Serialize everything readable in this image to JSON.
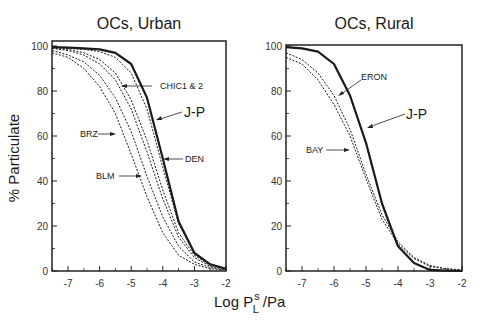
{
  "chart_data": [
    {
      "type": "line",
      "title": "OCs, Urban",
      "xlabel": "Log P_L^s /Pa",
      "ylabel": "% Particulate",
      "xlim": [
        -7.5,
        -2
      ],
      "ylim": [
        0,
        100
      ],
      "xticks": [
        -7,
        -6,
        -5,
        -4,
        -3,
        -2
      ],
      "yticks": [
        0,
        20,
        40,
        60,
        80,
        100
      ],
      "grid": false,
      "x": [
        -7.5,
        -7,
        -6.5,
        -6,
        -5.5,
        -5,
        -4.5,
        -4,
        -3.5,
        -3,
        -2.5,
        -2
      ],
      "series": [
        {
          "name": "J-P",
          "style": "solid-bold",
          "values": [
            99.5,
            99.3,
            99,
            98.5,
            97,
            92,
            77,
            50,
            22,
            8,
            3,
            1
          ]
        },
        {
          "name": "DEN",
          "style": "dotted",
          "values": [
            99.5,
            99,
            98.5,
            97.5,
            95,
            88,
            72,
            46,
            21,
            8,
            3,
            1
          ]
        },
        {
          "name": "CHIC1 & 2 (a)",
          "style": "dotted",
          "values": [
            99,
            98.5,
            97,
            94,
            88,
            76,
            58,
            36,
            17,
            7,
            2.5,
            1
          ]
        },
        {
          "name": "CHIC1 & 2 (b)",
          "style": "dotted",
          "values": [
            99,
            98,
            96,
            92,
            85,
            72,
            53,
            32,
            15,
            6,
            2,
            1
          ]
        },
        {
          "name": "BRZ",
          "style": "dotted",
          "values": [
            98,
            96,
            93,
            87,
            77,
            62,
            42,
            24,
            11,
            4,
            1.5,
            0.5
          ]
        },
        {
          "name": "BLM",
          "style": "dotted",
          "values": [
            97,
            95,
            90,
            82,
            70,
            52,
            33,
            17,
            7,
            3,
            1,
            0.5
          ]
        }
      ],
      "annotations": [
        "CHIC1 & 2",
        "J-P",
        "BRZ",
        "DEN",
        "BLM"
      ]
    },
    {
      "type": "line",
      "title": "OCs, Rural",
      "xlabel": "Log P_L^s /Pa",
      "ylabel": "% Particulate",
      "xlim": [
        -7.5,
        -2
      ],
      "ylim": [
        0,
        100
      ],
      "xticks": [
        -7,
        -6,
        -5,
        -4,
        -3,
        -2
      ],
      "yticks": [
        0,
        20,
        40,
        60,
        80,
        100
      ],
      "grid": false,
      "x": [
        -7.5,
        -7,
        -6.5,
        -6,
        -5.5,
        -5,
        -4.5,
        -4,
        -3.5,
        -3,
        -2.5,
        -2
      ],
      "series": [
        {
          "name": "J-P",
          "style": "solid-bold",
          "values": [
            99.5,
            99,
            97.5,
            92,
            78,
            57,
            30,
            11,
            3.5,
            0.5,
            0.2,
            0
          ]
        },
        {
          "name": "ERON",
          "style": "dotted",
          "values": [
            97,
            94,
            88,
            78,
            63,
            43,
            25,
            13,
            6,
            2.5,
            1,
            0.5
          ]
        },
        {
          "name": "BAY",
          "style": "dotted",
          "values": [
            95,
            92,
            85,
            74,
            60,
            41,
            23,
            12,
            5.5,
            2,
            1,
            0.5
          ]
        }
      ],
      "annotations": [
        "ERON",
        "J-P",
        "BAY"
      ]
    }
  ],
  "labels": {
    "left_title": "OCs, Urban",
    "right_title": "OCs, Rural",
    "ylabel": "% Particulate",
    "xlabel_main": "Log P",
    "xlabel_sup": "s",
    "xlabel_sub": "L",
    "xlabel_tail": "/Pa",
    "left_annotations": {
      "chic": "CHIC1 & 2",
      "jp": "J-P",
      "brz": "BRZ",
      "den": "DEN",
      "blm": "BLM"
    },
    "right_annotations": {
      "eron": "ERON",
      "jp": "J-P",
      "bay": "BAY"
    }
  }
}
